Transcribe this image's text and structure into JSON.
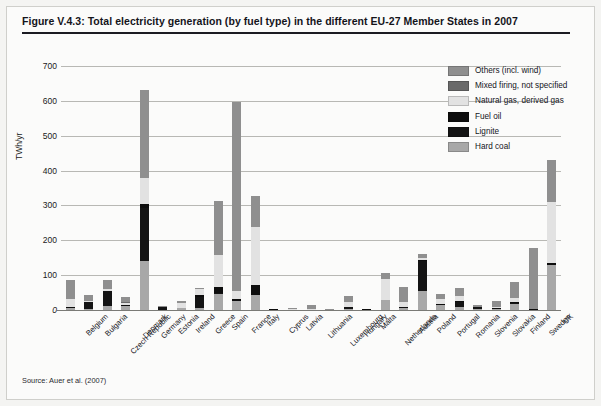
{
  "figure": {
    "title": "Figure V.4.3: Total electricity generation (by fuel type) in the different EU-27 Member States in 2007",
    "source": "Source: Auer et al. (2007)"
  },
  "colors": {
    "others": "#8f8f8f",
    "mixed_firing": "#6a6a6a",
    "natural_gas": "#e2e2e2",
    "fuel_oil": "#0d0d0d",
    "lignite": "#141414",
    "hard_coal": "#a8a8a8",
    "gridline": "#b8b8b4",
    "axis": "#7a7a76",
    "background": "#fbfbfa",
    "text": "#14141a"
  },
  "chart_data": {
    "type": "bar",
    "stacked": true,
    "title": "Total electricity generation (by fuel type) in the different EU-27 Member States in 2007",
    "xlabel": "",
    "ylabel": "TWh/yr",
    "ylim": [
      0,
      700
    ],
    "yticks": [
      0,
      100,
      200,
      300,
      400,
      500,
      600,
      700
    ],
    "ytick_labels": [
      "0",
      "100",
      "200",
      "300",
      "400",
      "500",
      "600",
      "700"
    ],
    "grid": true,
    "legend_position": "top-right",
    "categories": [
      "Belgium",
      "Bulgaria",
      "Czech Republic",
      "Denmark",
      "Germany",
      "Estonia",
      "Ireland",
      "Greece",
      "Spain",
      "France",
      "Italy",
      "Cyprus",
      "Latvia",
      "Lithuania",
      "Luxembourg",
      "Hungary",
      "Malta",
      "Netherlands",
      "Austria",
      "Poland",
      "Portugal",
      "Romania",
      "Slovenia",
      "Slovakia",
      "Finland",
      "Sweden",
      "UK"
    ],
    "series": [
      {
        "name": "Hard coal",
        "color": "#a8a8a8",
        "values": [
          7,
          4,
          11,
          13,
          142,
          0,
          5,
          6,
          47,
          26,
          44,
          0,
          0,
          0,
          0,
          2,
          0,
          28,
          5,
          54,
          14,
          9,
          4,
          4,
          16,
          2,
          130
        ]
      },
      {
        "name": "Lignite",
        "color": "#141414",
        "values": [
          0,
          18,
          44,
          0,
          150,
          9,
          0,
          31,
          2,
          0,
          0,
          0,
          0,
          0,
          0,
          7,
          0,
          0,
          2,
          88,
          0,
          16,
          4,
          0,
          6,
          0,
          0
        ]
      },
      {
        "name": "Fuel oil",
        "color": "#0d0d0d",
        "values": [
          1,
          0,
          0,
          1,
          11,
          0,
          1,
          7,
          16,
          6,
          28,
          4,
          1,
          1,
          0,
          1,
          2,
          1,
          1,
          2,
          4,
          1,
          0,
          1,
          1,
          1,
          5
        ]
      },
      {
        "name": "Natural gas, derived gas",
        "color": "#e2e2e2",
        "values": [
          24,
          3,
          6,
          6,
          77,
          0,
          13,
          16,
          93,
          22,
          167,
          0,
          2,
          2,
          0,
          12,
          0,
          59,
          16,
          6,
          14,
          13,
          1,
          3,
          12,
          1,
          175
        ]
      },
      {
        "name": "Mixed firing, not specified",
        "color": "#6a6a6a",
        "values": [
          0,
          0,
          0,
          2,
          0,
          0,
          0,
          0,
          0,
          0,
          0,
          0,
          0,
          0,
          0,
          0,
          0,
          0,
          0,
          0,
          0,
          0,
          0,
          0,
          0,
          0,
          0
        ]
      },
      {
        "name": "Others (incl. wind)",
        "color": "#8f8f8f",
        "values": [
          55,
          19,
          25,
          14,
          250,
          2,
          6,
          4,
          155,
          542,
          87,
          0,
          2,
          10,
          3,
          17,
          0,
          17,
          41,
          10,
          15,
          23,
          6,
          19,
          46,
          173,
          120
        ]
      }
    ],
    "totals": [
      87,
      44,
      86,
      36,
      630,
      11,
      25,
      64,
      313,
      596,
      326,
      4,
      5,
      13,
      3,
      39,
      2,
      105,
      65,
      160,
      47,
      62,
      15,
      27,
      81,
      177,
      430
    ]
  },
  "legend": {
    "items": [
      {
        "label": "Others (incl. wind)",
        "color": "#8f8f8f"
      },
      {
        "label": "Mixed firing, not specified",
        "color": "#6a6a6a"
      },
      {
        "label": "Natural gas, derived gas",
        "color": "#e2e2e2"
      },
      {
        "label": "Fuel oil",
        "color": "#0d0d0d"
      },
      {
        "label": "Lignite",
        "color": "#141414"
      },
      {
        "label": "Hard coal",
        "color": "#a8a8a8"
      }
    ]
  }
}
